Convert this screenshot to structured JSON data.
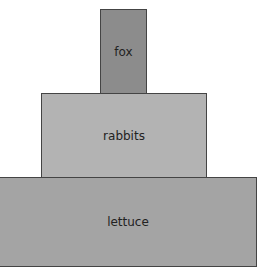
{
  "diagram": {
    "type": "food-pyramid",
    "levels": [
      {
        "label": "fox",
        "color": "#8c8c8c"
      },
      {
        "label": "rabbits",
        "color": "#b3b3b3"
      },
      {
        "label": "lettuce",
        "color": "#a4a4a4"
      }
    ]
  }
}
